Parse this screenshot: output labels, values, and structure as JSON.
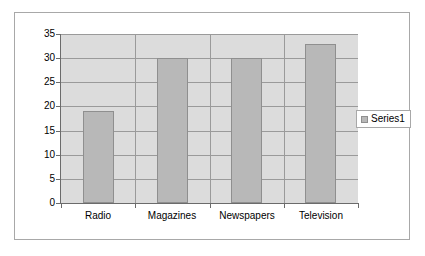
{
  "chart_data": {
    "type": "bar",
    "title": "",
    "subtitle": "",
    "xlabel": "",
    "ylabel": "",
    "categories": [
      "Radio",
      "Magazines",
      "Newspapers",
      "Television"
    ],
    "series": [
      {
        "name": "Series1",
        "values": [
          19,
          30,
          30,
          33
        ]
      }
    ],
    "ylim": [
      0,
      35
    ],
    "ytick_labels": [
      "35",
      "30",
      "25",
      "20",
      "15",
      "10",
      "5",
      "0"
    ],
    "ytick_values": [
      35,
      30,
      25,
      20,
      15,
      10,
      5,
      0
    ],
    "grid": true,
    "legend_position": "right",
    "colors": {
      "bar_fill": "#b8b8b8",
      "bar_border": "#8f8f8f",
      "plot_background": "#dcdcdc",
      "gridline": "#9a9a9a",
      "axis": "#6b6b6b",
      "frame_border": "#a8a8a8",
      "text": "#000000"
    }
  },
  "legend": {
    "entries": [
      {
        "label": "Series1"
      }
    ]
  }
}
